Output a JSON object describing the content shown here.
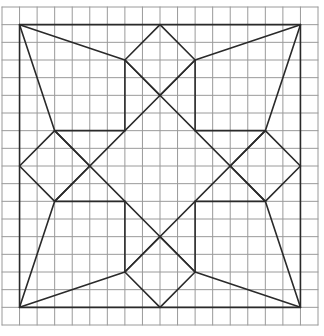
{
  "diagram": {
    "type": "quilt-block-grid",
    "grid": {
      "columns": 18,
      "rows": 18,
      "left_px": 2,
      "top_px": 7,
      "right_px": 318,
      "bottom_px": 325,
      "color": "#9a9a9a"
    },
    "stroke_color": "#2a2a2a",
    "outer_square": [
      [
        1,
        1
      ],
      [
        17,
        1
      ],
      [
        17,
        17
      ],
      [
        1,
        17
      ]
    ],
    "diamonds": {
      "top": [
        [
          9,
          1
        ],
        [
          11,
          3
        ],
        [
          9,
          5
        ],
        [
          7,
          3
        ]
      ],
      "right": [
        [
          17,
          9
        ],
        [
          15,
          11
        ],
        [
          13,
          9
        ],
        [
          15,
          7
        ]
      ],
      "bottom": [
        [
          9,
          17
        ],
        [
          7,
          15
        ],
        [
          9,
          13
        ],
        [
          11,
          15
        ]
      ],
      "left": [
        [
          1,
          9
        ],
        [
          3,
          7
        ],
        [
          5,
          9
        ],
        [
          3,
          11
        ]
      ]
    },
    "segments": [
      [
        [
          7,
          3
        ],
        [
          7,
          7
        ]
      ],
      [
        [
          11,
          3
        ],
        [
          11,
          7
        ]
      ],
      [
        [
          7,
          11
        ],
        [
          7,
          15
        ]
      ],
      [
        [
          11,
          11
        ],
        [
          11,
          15
        ]
      ],
      [
        [
          3,
          7
        ],
        [
          7,
          7
        ]
      ],
      [
        [
          11,
          7
        ],
        [
          15,
          7
        ]
      ],
      [
        [
          3,
          11
        ],
        [
          7,
          11
        ]
      ],
      [
        [
          11,
          11
        ],
        [
          15,
          11
        ]
      ],
      [
        [
          7,
          3
        ],
        [
          15,
          11
        ]
      ],
      [
        [
          11,
          3
        ],
        [
          3,
          11
        ]
      ],
      [
        [
          3,
          7
        ],
        [
          11,
          15
        ]
      ],
      [
        [
          15,
          7
        ],
        [
          7,
          15
        ]
      ],
      [
        [
          1,
          1
        ],
        [
          7,
          3
        ]
      ],
      [
        [
          1,
          1
        ],
        [
          3,
          7
        ]
      ],
      [
        [
          17,
          1
        ],
        [
          11,
          3
        ]
      ],
      [
        [
          17,
          1
        ],
        [
          15,
          7
        ]
      ],
      [
        [
          1,
          17
        ],
        [
          3,
          11
        ]
      ],
      [
        [
          1,
          17
        ],
        [
          7,
          15
        ]
      ],
      [
        [
          17,
          17
        ],
        [
          15,
          11
        ]
      ],
      [
        [
          17,
          17
        ],
        [
          11,
          15
        ]
      ]
    ]
  }
}
